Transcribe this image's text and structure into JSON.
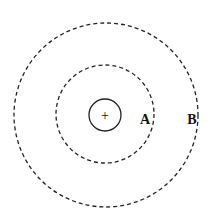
{
  "diagram": {
    "center_symbol": "+",
    "charge_sign": "positive",
    "labels": {
      "a": "A",
      "b": "B"
    },
    "circles": [
      {
        "name": "charge-circle",
        "style": "solid"
      },
      {
        "name": "equipotential-a",
        "style": "dashed"
      },
      {
        "name": "equipotential-b",
        "style": "dashed"
      }
    ]
  }
}
